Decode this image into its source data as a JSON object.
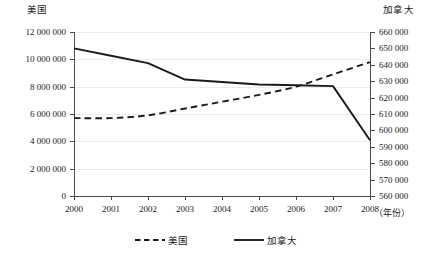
{
  "chart_data": {
    "type": "line",
    "title": "",
    "xlabel": "（年份）",
    "x": [
      2000,
      2001,
      2002,
      2003,
      2004,
      2005,
      2006,
      2007,
      2008
    ],
    "xticklabels": [
      "2000",
      "2001",
      "2002",
      "2003",
      "2004",
      "2005",
      "2006",
      "2007",
      "2008"
    ],
    "grid": true,
    "legend_position": "bottom-center",
    "axes": [
      {
        "id": "left",
        "title": "美国",
        "ylim": [
          0,
          12000000
        ],
        "ytick_step": 2000000,
        "yticklabels": [
          "0",
          "2 000 000",
          "4 000 000",
          "6 000 000",
          "8 000 000",
          "10 000 000",
          "12 000 000"
        ],
        "ytickvalues": [
          0,
          2000000,
          4000000,
          6000000,
          8000000,
          10000000,
          12000000
        ]
      },
      {
        "id": "right",
        "title": "加拿大",
        "ylim": [
          560000,
          660000
        ],
        "ytick_step": 10000,
        "yticklabels": [
          "560 000",
          "570 000",
          "580 000",
          "590 000",
          "600 000",
          "610 000",
          "620 000",
          "630 000",
          "640 000",
          "650 000",
          "660 000"
        ],
        "ytickvalues": [
          560000,
          570000,
          580000,
          590000,
          600000,
          610000,
          620000,
          630000,
          640000,
          650000,
          660000
        ]
      }
    ],
    "series": [
      {
        "name": "美国",
        "axis": "left",
        "style": "dashed",
        "color": "#1a1a1a",
        "values": [
          5700000,
          5700000,
          5900000,
          6400000,
          6900000,
          7400000,
          8000000,
          8900000,
          9800000
        ]
      },
      {
        "name": "加拿大",
        "axis": "right",
        "style": "solid",
        "color": "#1a1a1a",
        "values": [
          650000,
          645500,
          641000,
          631000,
          629500,
          628000,
          627500,
          627000,
          594000
        ]
      }
    ],
    "legend": [
      {
        "label": "美国",
        "style": "dashed"
      },
      {
        "label": "加拿大",
        "style": "solid"
      }
    ]
  }
}
